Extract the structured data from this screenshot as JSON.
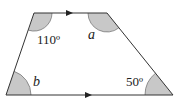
{
  "figure": {
    "type": "trapezium",
    "colors": {
      "stroke": "#333333",
      "shade": "#c8c8c8",
      "background": "#ffffff"
    },
    "vertices": {
      "top_left": [
        34,
        13
      ],
      "top_right": [
        107,
        13
      ],
      "bottom_right": [
        173,
        95
      ],
      "bottom_left": [
        6,
        95
      ]
    },
    "parallel_marks": [
      "top-side-arrow",
      "bottom-side-arrow"
    ],
    "angles": [
      {
        "vertex": "top_left",
        "label": "110º",
        "kind": "known"
      },
      {
        "vertex": "top_right",
        "label": "a",
        "kind": "unknown"
      },
      {
        "vertex": "bottom_left",
        "label": "b",
        "kind": "unknown"
      },
      {
        "vertex": "bottom_right",
        "label": "50º",
        "kind": "known"
      }
    ]
  }
}
